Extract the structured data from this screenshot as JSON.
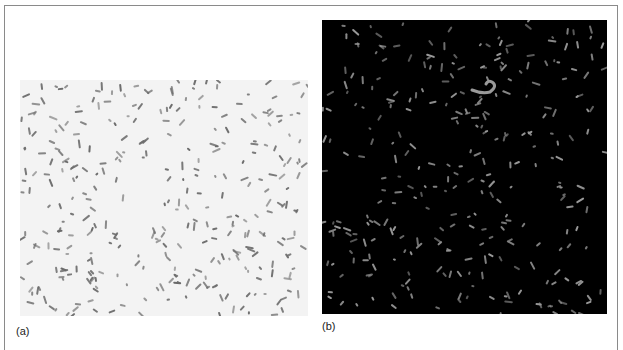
{
  "figure": {
    "panels": [
      {
        "id": "a",
        "label": "(a)",
        "description": "Bright-field micrograph of rod-shaped bacteria on light background",
        "background_color": "#f3f3f3",
        "cell_color": "#6a6a6a",
        "cell_count": 330,
        "seed": 17
      },
      {
        "id": "b",
        "label": "(b)",
        "description": "Fluorescence micrograph of rod-shaped bacteria on black background",
        "background_color": "#000000",
        "cell_color": "#9a9a9a",
        "cell_count": 300,
        "seed": 91
      }
    ]
  }
}
